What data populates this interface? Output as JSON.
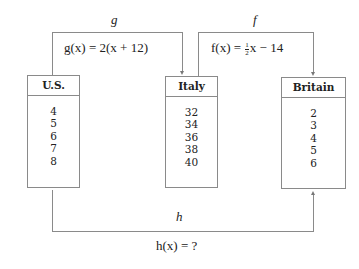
{
  "sets": [
    {
      "name": "U.S.",
      "values": [
        "4",
        "5",
        "6",
        "7",
        "8"
      ]
    },
    {
      "name": "Italy",
      "values": [
        "32",
        "34",
        "36",
        "38",
        "40"
      ]
    },
    {
      "name": "Britain",
      "values": [
        "2",
        "3",
        "4",
        "5",
        "6"
      ]
    }
  ],
  "mappings": {
    "g": {
      "label": "g",
      "formula": "g(x) = 2(x + 12)",
      "from": "U.S.",
      "to": "Italy"
    },
    "f": {
      "label": "f",
      "formula_prefix": "f(x) = ",
      "frac_num": "1",
      "frac_den": "2",
      "formula_suffix": "x − 14",
      "from": "Italy",
      "to": "Britain"
    },
    "h": {
      "label": "h",
      "formula": "h(x) = ?",
      "from": "U.S.",
      "to": "Britain"
    }
  },
  "colors": {
    "line": "#8a8a8a",
    "text": "#222222",
    "background": "#ffffff"
  }
}
